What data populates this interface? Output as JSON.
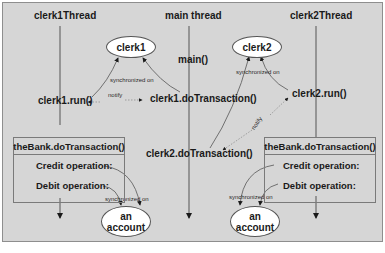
{
  "diagram": {
    "threads": [
      {
        "id": "clerk1Thread",
        "label": "clerk1Thread"
      },
      {
        "id": "main",
        "label": "main thread"
      },
      {
        "id": "clerk2Thread",
        "label": "clerk2Thread"
      }
    ],
    "objects": {
      "clerk1": "clerk1",
      "clerk2": "clerk2",
      "account_left": {
        "line1": "an",
        "line2": "account"
      },
      "account_right": {
        "line1": "an",
        "line2": "account"
      }
    },
    "calls": {
      "main": "main()",
      "clerk1_run": "clerk1.run()",
      "clerk1_doTransaction": "clerk1.doTransaction()",
      "clerk2_run": "clerk2.run()",
      "clerk2_doTransaction": "clerk2.doTransaction()"
    },
    "edge_labels": {
      "sync_clerk1": "synchronized on",
      "sync_clerk2": "synchronized on",
      "notify_1": "notify",
      "notify_2": "notify",
      "sync_account_left": "synchronized on",
      "sync_account_right": "synchronized on"
    },
    "bank_boxes": [
      {
        "title": "theBank.doTransaction()",
        "credit": "Credit operation:",
        "debit": "Debit operation:"
      },
      {
        "title": "theBank.doTransaction()",
        "credit": "Credit operation:",
        "debit": "Debit operation:"
      }
    ],
    "colors": {
      "background": "#d6d6d6",
      "line": "#4a4a4a",
      "ellipse_fill": "#ffffff"
    }
  }
}
